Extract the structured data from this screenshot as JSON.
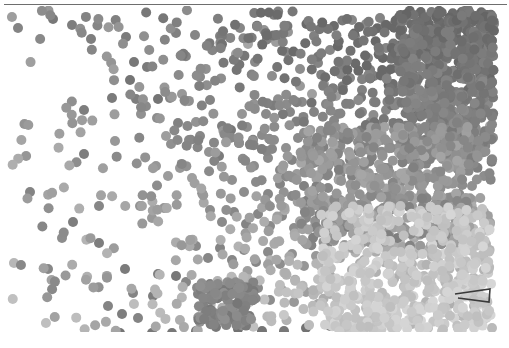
{
  "figure": {
    "width": 509,
    "height": 348,
    "background": "#ffffff",
    "top_rule": {
      "color": "#6e6e6e",
      "x": 4,
      "y": 4,
      "width": 503,
      "height": 1
    }
  },
  "chart_data": {
    "type": "scatter",
    "title": "",
    "subtitle": "",
    "xlabel": "",
    "ylabel": "",
    "grid": false,
    "legend": null,
    "axis_visible": false,
    "tick_labels_x": [],
    "tick_labels_y": [],
    "xlim": [
      0,
      509
    ],
    "ylim": [
      0,
      326
    ],
    "marker": {
      "shape": "circle",
      "diameter_px": 10,
      "edge": "none",
      "colormap": "grayscale",
      "color_low": "#e2e2e2",
      "color_high": "#4a4a4a"
    },
    "annotations": [
      {
        "name": "chevron-mark",
        "type": "polyline",
        "color": "#3a3a3a",
        "points": "455,288 490,283 489,296 458,292"
      }
    ],
    "points": [
      [
        18,
        22,
        0.62
      ],
      [
        53,
        13,
        0.7
      ],
      [
        72,
        19,
        0.66
      ],
      [
        91,
        33,
        0.66
      ],
      [
        126,
        31,
        0.68
      ],
      [
        195,
        29,
        0.61
      ],
      [
        134,
        56,
        0.7
      ],
      [
        147,
        61,
        0.68
      ],
      [
        130,
        74,
        0.72
      ],
      [
        136,
        93,
        0.66
      ],
      [
        158,
        93,
        0.72
      ],
      [
        170,
        92,
        0.6
      ],
      [
        182,
        88,
        0.49
      ],
      [
        210,
        94,
        0.62
      ],
      [
        84,
        104,
        0.66
      ],
      [
        112,
        92,
        0.68
      ],
      [
        141,
        108,
        0.53
      ],
      [
        157,
        112,
        0.56
      ],
      [
        178,
        117,
        0.63
      ],
      [
        196,
        116,
        0.52
      ],
      [
        200,
        130,
        0.6
      ],
      [
        115,
        135,
        0.49
      ],
      [
        171,
        138,
        0.54
      ],
      [
        166,
        130,
        0.45
      ],
      [
        189,
        134,
        0.58
      ],
      [
        84,
        148,
        0.66
      ],
      [
        222,
        120,
        0.65
      ],
      [
        231,
        124,
        0.7
      ],
      [
        239,
        137,
        0.62
      ],
      [
        247,
        121,
        0.55
      ],
      [
        252,
        139,
        0.47
      ],
      [
        262,
        129,
        0.58
      ],
      [
        272,
        143,
        0.6
      ],
      [
        209,
        146,
        0.52
      ],
      [
        219,
        150,
        0.68
      ],
      [
        30,
        186,
        0.62
      ],
      [
        99,
        200,
        0.6
      ],
      [
        73,
        216,
        0.66
      ],
      [
        62,
        232,
        0.56
      ],
      [
        48,
        263,
        0.6
      ],
      [
        99,
        237,
        0.66
      ],
      [
        125,
        263,
        0.68
      ],
      [
        158,
        268,
        0.66
      ],
      [
        176,
        270,
        0.7
      ],
      [
        133,
        287,
        0.62
      ],
      [
        153,
        290,
        0.66
      ],
      [
        120,
        327,
        0.72
      ],
      [
        152,
        327,
        0.7
      ],
      [
        172,
        327,
        0.7
      ],
      [
        196,
        325,
        0.7
      ],
      [
        216,
        321,
        0.7
      ],
      [
        238,
        323,
        0.74
      ],
      [
        262,
        325,
        0.72
      ],
      [
        284,
        325,
        0.7
      ],
      [
        306,
        322,
        0.74
      ],
      [
        220,
        30,
        0.63
      ],
      [
        240,
        22,
        0.6
      ],
      [
        255,
        56,
        0.58
      ],
      [
        272,
        70,
        0.55
      ],
      [
        286,
        46,
        0.6
      ],
      [
        300,
        63,
        0.56
      ],
      [
        314,
        30,
        0.64
      ],
      [
        318,
        57,
        0.62
      ],
      [
        330,
        44,
        0.6
      ],
      [
        342,
        60,
        0.66
      ],
      [
        355,
        30,
        0.64
      ],
      [
        368,
        52,
        0.62
      ],
      [
        350,
        72,
        0.6
      ],
      [
        362,
        84,
        0.64
      ],
      [
        374,
        70,
        0.66
      ],
      [
        386,
        42,
        0.62
      ],
      [
        396,
        62,
        0.64
      ],
      [
        404,
        38,
        0.6
      ],
      [
        416,
        54,
        0.64
      ],
      [
        424,
        30,
        0.62
      ],
      [
        432,
        48,
        0.66
      ],
      [
        440,
        24,
        0.6
      ],
      [
        448,
        44,
        0.62
      ],
      [
        456,
        28,
        0.66
      ],
      [
        464,
        50,
        0.64
      ],
      [
        472,
        32,
        0.6
      ],
      [
        480,
        46,
        0.64
      ],
      [
        488,
        26,
        0.62
      ],
      [
        352,
        14,
        0.6
      ],
      [
        366,
        18,
        0.58
      ],
      [
        380,
        12,
        0.62
      ],
      [
        392,
        20,
        0.6
      ],
      [
        406,
        14,
        0.64
      ],
      [
        418,
        18,
        0.62
      ],
      [
        430,
        10,
        0.6
      ],
      [
        444,
        16,
        0.64
      ],
      [
        456,
        12,
        0.62
      ],
      [
        468,
        18,
        0.6
      ],
      [
        482,
        14,
        0.64
      ],
      [
        494,
        18,
        0.6
      ],
      [
        408,
        78,
        0.62
      ],
      [
        420,
        70,
        0.64
      ],
      [
        432,
        84,
        0.62
      ],
      [
        444,
        72,
        0.6
      ],
      [
        456,
        86,
        0.64
      ],
      [
        468,
        74,
        0.62
      ],
      [
        480,
        88,
        0.6
      ],
      [
        492,
        76,
        0.64
      ],
      [
        416,
        96,
        0.6
      ],
      [
        428,
        104,
        0.58
      ],
      [
        440,
        94,
        0.62
      ],
      [
        452,
        106,
        0.56
      ],
      [
        464,
        96,
        0.6
      ],
      [
        476,
        108,
        0.54
      ],
      [
        488,
        98,
        0.58
      ],
      [
        398,
        96,
        0.62
      ],
      [
        386,
        104,
        0.6
      ],
      [
        374,
        96,
        0.62
      ],
      [
        362,
        106,
        0.6
      ],
      [
        350,
        98,
        0.64
      ],
      [
        338,
        108,
        0.62
      ],
      [
        326,
        98,
        0.6
      ],
      [
        314,
        106,
        0.62
      ],
      [
        302,
        96,
        0.58
      ],
      [
        290,
        106,
        0.6
      ],
      [
        278,
        98,
        0.56
      ],
      [
        266,
        108,
        0.58
      ],
      [
        254,
        98,
        0.52
      ],
      [
        242,
        108,
        0.5
      ],
      [
        254,
        160,
        0.56
      ],
      [
        268,
        152,
        0.58
      ],
      [
        280,
        164,
        0.6
      ],
      [
        292,
        154,
        0.62
      ],
      [
        304,
        166,
        0.6
      ],
      [
        316,
        156,
        0.64
      ],
      [
        328,
        168,
        0.62
      ],
      [
        340,
        158,
        0.6
      ],
      [
        352,
        170,
        0.64
      ],
      [
        364,
        160,
        0.62
      ],
      [
        376,
        172,
        0.58
      ],
      [
        388,
        162,
        0.6
      ],
      [
        400,
        174,
        0.56
      ],
      [
        412,
        164,
        0.58
      ],
      [
        424,
        176,
        0.54
      ],
      [
        436,
        166,
        0.56
      ],
      [
        448,
        178,
        0.52
      ],
      [
        460,
        168,
        0.58
      ],
      [
        472,
        180,
        0.54
      ],
      [
        484,
        170,
        0.56
      ],
      [
        232,
        174,
        0.54
      ],
      [
        244,
        186,
        0.56
      ],
      [
        256,
        176,
        0.58
      ],
      [
        268,
        188,
        0.6
      ],
      [
        280,
        178,
        0.62
      ],
      [
        292,
        190,
        0.6
      ],
      [
        304,
        180,
        0.64
      ],
      [
        316,
        192,
        0.62
      ],
      [
        328,
        182,
        0.6
      ],
      [
        340,
        194,
        0.58
      ],
      [
        352,
        184,
        0.6
      ],
      [
        364,
        196,
        0.56
      ],
      [
        376,
        186,
        0.52
      ],
      [
        388,
        198,
        0.5
      ],
      [
        400,
        188,
        0.48
      ],
      [
        412,
        200,
        0.46
      ],
      [
        424,
        190,
        0.48
      ],
      [
        436,
        202,
        0.44
      ],
      [
        448,
        192,
        0.46
      ],
      [
        460,
        204,
        0.42
      ],
      [
        472,
        194,
        0.44
      ],
      [
        484,
        206,
        0.4
      ],
      [
        210,
        204,
        0.56
      ],
      [
        222,
        216,
        0.58
      ],
      [
        234,
        206,
        0.6
      ],
      [
        246,
        218,
        0.62
      ],
      [
        258,
        208,
        0.6
      ],
      [
        270,
        220,
        0.58
      ],
      [
        282,
        210,
        0.6
      ],
      [
        294,
        222,
        0.56
      ],
      [
        306,
        212,
        0.58
      ],
      [
        318,
        224,
        0.54
      ],
      [
        330,
        214,
        0.56
      ],
      [
        342,
        226,
        0.5
      ],
      [
        354,
        216,
        0.48
      ],
      [
        366,
        228,
        0.44
      ],
      [
        378,
        218,
        0.42
      ],
      [
        390,
        230,
        0.38
      ],
      [
        402,
        220,
        0.4
      ],
      [
        414,
        232,
        0.36
      ],
      [
        426,
        222,
        0.38
      ],
      [
        438,
        234,
        0.34
      ],
      [
        450,
        224,
        0.4
      ],
      [
        462,
        236,
        0.36
      ],
      [
        474,
        226,
        0.38
      ],
      [
        486,
        238,
        0.32
      ],
      [
        196,
        240,
        0.58
      ],
      [
        208,
        252,
        0.6
      ],
      [
        220,
        242,
        0.62
      ],
      [
        232,
        254,
        0.6
      ],
      [
        244,
        244,
        0.58
      ],
      [
        256,
        256,
        0.6
      ],
      [
        268,
        246,
        0.58
      ],
      [
        280,
        258,
        0.56
      ],
      [
        292,
        248,
        0.54
      ],
      [
        304,
        260,
        0.5
      ],
      [
        316,
        250,
        0.48
      ],
      [
        328,
        262,
        0.44
      ],
      [
        340,
        252,
        0.42
      ],
      [
        352,
        264,
        0.38
      ],
      [
        364,
        254,
        0.36
      ],
      [
        376,
        266,
        0.32
      ],
      [
        388,
        256,
        0.3
      ],
      [
        400,
        268,
        0.28
      ],
      [
        412,
        258,
        0.3
      ],
      [
        424,
        270,
        0.26
      ],
      [
        436,
        260,
        0.3
      ],
      [
        448,
        272,
        0.28
      ],
      [
        460,
        262,
        0.34
      ],
      [
        472,
        274,
        0.26
      ],
      [
        484,
        264,
        0.3
      ],
      [
        186,
        276,
        0.6
      ],
      [
        198,
        288,
        0.64
      ],
      [
        210,
        278,
        0.66
      ],
      [
        222,
        290,
        0.68
      ],
      [
        234,
        280,
        0.64
      ],
      [
        246,
        292,
        0.6
      ],
      [
        258,
        282,
        0.58
      ],
      [
        270,
        294,
        0.56
      ],
      [
        282,
        284,
        0.52
      ],
      [
        294,
        296,
        0.48
      ],
      [
        306,
        286,
        0.44
      ],
      [
        318,
        298,
        0.4
      ],
      [
        330,
        288,
        0.36
      ],
      [
        342,
        300,
        0.32
      ],
      [
        354,
        290,
        0.28
      ],
      [
        366,
        302,
        0.26
      ],
      [
        378,
        292,
        0.24
      ],
      [
        390,
        304,
        0.22
      ],
      [
        402,
        294,
        0.26
      ],
      [
        414,
        306,
        0.24
      ],
      [
        426,
        296,
        0.3
      ],
      [
        438,
        308,
        0.26
      ],
      [
        450,
        298,
        0.34
      ],
      [
        462,
        310,
        0.28
      ],
      [
        474,
        300,
        0.32
      ],
      [
        486,
        312,
        0.26
      ],
      [
        330,
        320,
        0.62
      ],
      [
        348,
        318,
        0.56
      ],
      [
        364,
        322,
        0.5
      ],
      [
        380,
        318,
        0.42
      ],
      [
        396,
        322,
        0.36
      ],
      [
        412,
        318,
        0.3
      ],
      [
        428,
        322,
        0.26
      ],
      [
        444,
        318,
        0.34
      ],
      [
        460,
        322,
        0.28
      ],
      [
        476,
        318,
        0.3
      ],
      [
        492,
        322,
        0.26
      ],
      [
        264,
        24,
        0.52
      ],
      [
        276,
        36,
        0.46
      ],
      [
        288,
        26,
        0.5
      ],
      [
        236,
        48,
        0.44
      ],
      [
        248,
        38,
        0.4
      ],
      [
        300,
        80,
        0.48
      ],
      [
        312,
        88,
        0.44
      ],
      [
        324,
        78,
        0.42
      ],
      [
        336,
        90,
        0.46
      ],
      [
        156,
        160,
        0.5
      ],
      [
        168,
        170,
        0.46
      ],
      [
        180,
        162,
        0.48
      ],
      [
        192,
        172,
        0.44
      ],
      [
        140,
        200,
        0.52
      ],
      [
        152,
        212,
        0.48
      ],
      [
        164,
        202,
        0.5
      ],
      [
        108,
        300,
        0.62
      ],
      [
        122,
        308,
        0.66
      ],
      [
        138,
        312,
        0.62
      ],
      [
        442,
        116,
        0.46
      ],
      [
        454,
        126,
        0.42
      ],
      [
        466,
        118,
        0.44
      ],
      [
        478,
        128,
        0.4
      ],
      [
        490,
        120,
        0.42
      ],
      [
        430,
        130,
        0.48
      ],
      [
        418,
        122,
        0.5
      ],
      [
        406,
        132,
        0.52
      ],
      [
        394,
        124,
        0.54
      ],
      [
        382,
        134,
        0.56
      ],
      [
        370,
        126,
        0.58
      ],
      [
        358,
        136,
        0.56
      ],
      [
        346,
        128,
        0.58
      ],
      [
        334,
        138,
        0.6
      ],
      [
        322,
        130,
        0.58
      ],
      [
        310,
        140,
        0.56
      ],
      [
        298,
        132,
        0.58
      ],
      [
        286,
        142,
        0.54
      ],
      [
        274,
        134,
        0.56
      ]
    ]
  }
}
